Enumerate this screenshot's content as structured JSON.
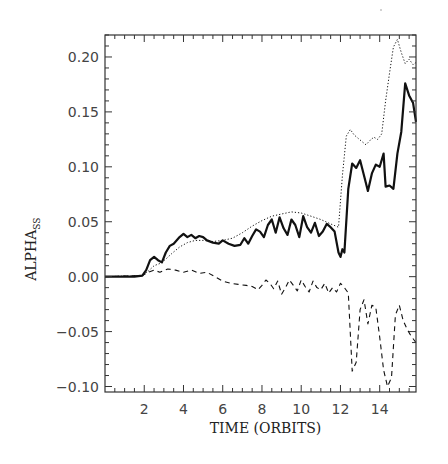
{
  "chart_data": {
    "type": "line",
    "title": "",
    "xlabel": "TIME (ORBITS)",
    "ylabel": "ALPHA",
    "ylabel_subscript": "SS",
    "xlim": [
      0,
      15.85
    ],
    "ylim": [
      -0.105,
      0.22
    ],
    "x_ticks": [
      2,
      4,
      6,
      8,
      10,
      12,
      14
    ],
    "x_minor_step": 0.5,
    "y_ticks": [
      -0.1,
      -0.05,
      0.0,
      0.05,
      0.1,
      0.15,
      0.2
    ],
    "y_tick_labels": [
      "−0.10",
      "−0.05",
      "0.00",
      "0.05",
      "0.10",
      "0.15",
      "0.20"
    ],
    "y_minor_step": 0.01,
    "grid": false,
    "legend": null,
    "series": [
      {
        "name": "total (solid)",
        "style": "solid",
        "x": [
          0,
          1.5,
          1.9,
          2.1,
          2.3,
          2.5,
          2.7,
          2.9,
          3.1,
          3.3,
          3.5,
          3.8,
          4.0,
          4.2,
          4.4,
          4.6,
          4.8,
          5.0,
          5.2,
          5.5,
          5.8,
          6.0,
          6.3,
          6.6,
          6.9,
          7.1,
          7.3,
          7.5,
          7.7,
          7.9,
          8.1,
          8.3,
          8.5,
          8.7,
          8.9,
          9.1,
          9.3,
          9.5,
          9.7,
          9.9,
          10.1,
          10.3,
          10.5,
          10.7,
          10.9,
          11.1,
          11.3,
          11.5,
          11.7,
          11.9,
          12.0,
          12.1,
          12.2,
          12.4,
          12.6,
          12.8,
          13.0,
          13.2,
          13.4,
          13.6,
          13.8,
          14.0,
          14.2,
          14.3,
          14.5,
          14.7,
          14.9,
          15.1,
          15.3,
          15.5,
          15.7,
          15.85
        ],
        "y": [
          0.0,
          0.0,
          0.001,
          0.006,
          0.015,
          0.018,
          0.015,
          0.013,
          0.022,
          0.028,
          0.03,
          0.036,
          0.039,
          0.036,
          0.038,
          0.035,
          0.037,
          0.036,
          0.033,
          0.031,
          0.03,
          0.033,
          0.03,
          0.028,
          0.029,
          0.035,
          0.03,
          0.037,
          0.043,
          0.041,
          0.036,
          0.047,
          0.052,
          0.04,
          0.054,
          0.044,
          0.038,
          0.052,
          0.047,
          0.036,
          0.055,
          0.045,
          0.04,
          0.049,
          0.037,
          0.041,
          0.048,
          0.045,
          0.041,
          0.022,
          0.018,
          0.025,
          0.022,
          0.08,
          0.103,
          0.099,
          0.106,
          0.092,
          0.078,
          0.094,
          0.102,
          0.1,
          0.112,
          0.082,
          0.083,
          0.08,
          0.112,
          0.132,
          0.176,
          0.165,
          0.158,
          0.141
        ]
      },
      {
        "name": "dotted",
        "style": "dotted",
        "x": [
          0,
          1.9,
          2.2,
          2.5,
          2.8,
          3.1,
          3.4,
          3.8,
          4.2,
          4.6,
          5.0,
          5.5,
          6.0,
          6.5,
          7.0,
          7.5,
          8.0,
          8.5,
          9.0,
          9.5,
          10.0,
          10.5,
          11.0,
          11.5,
          11.9,
          12.1,
          12.3,
          12.5,
          12.7,
          12.9,
          13.1,
          13.3,
          13.5,
          13.7,
          13.9,
          14.1,
          14.3,
          14.5,
          14.7,
          14.9,
          15.1,
          15.3,
          15.5,
          15.7,
          15.85
        ],
        "y": [
          0.0,
          0.001,
          0.005,
          0.01,
          0.012,
          0.016,
          0.021,
          0.027,
          0.031,
          0.033,
          0.033,
          0.032,
          0.033,
          0.035,
          0.04,
          0.046,
          0.051,
          0.055,
          0.057,
          0.059,
          0.058,
          0.055,
          0.052,
          0.048,
          0.045,
          0.092,
          0.128,
          0.134,
          0.129,
          0.126,
          0.123,
          0.12,
          0.124,
          0.127,
          0.125,
          0.13,
          0.16,
          0.185,
          0.209,
          0.216,
          0.204,
          0.194,
          0.198,
          0.193,
          0.195
        ]
      },
      {
        "name": "dashed",
        "style": "dashed",
        "x": [
          0,
          1.9,
          2.2,
          2.5,
          2.8,
          3.2,
          3.6,
          4.0,
          4.4,
          4.8,
          5.2,
          5.6,
          6.0,
          6.4,
          6.8,
          7.2,
          7.5,
          7.8,
          8.0,
          8.2,
          8.4,
          8.6,
          8.8,
          9.0,
          9.2,
          9.4,
          9.6,
          9.8,
          10.0,
          10.2,
          10.4,
          10.6,
          10.8,
          11.0,
          11.2,
          11.4,
          11.6,
          11.8,
          12.0,
          12.2,
          12.4,
          12.6,
          12.8,
          13.0,
          13.2,
          13.4,
          13.6,
          13.8,
          14.0,
          14.2,
          14.4,
          14.6,
          14.8,
          15.0,
          15.2,
          15.4,
          15.6,
          15.85
        ],
        "y": [
          0.0,
          0.001,
          0.004,
          0.006,
          0.004,
          0.007,
          0.006,
          0.004,
          0.006,
          0.003,
          0.004,
          0.0,
          -0.004,
          -0.006,
          -0.007,
          -0.008,
          -0.009,
          -0.012,
          -0.008,
          -0.003,
          -0.006,
          -0.011,
          -0.004,
          -0.016,
          -0.01,
          -0.003,
          -0.008,
          -0.013,
          -0.003,
          -0.009,
          -0.014,
          -0.004,
          -0.01,
          -0.012,
          -0.006,
          -0.015,
          -0.01,
          -0.014,
          -0.006,
          -0.01,
          -0.015,
          -0.086,
          -0.078,
          -0.03,
          -0.021,
          -0.043,
          -0.026,
          -0.028,
          -0.055,
          -0.085,
          -0.1,
          -0.092,
          -0.035,
          -0.026,
          -0.04,
          -0.048,
          -0.054,
          -0.06
        ]
      }
    ]
  },
  "colors": {
    "axis": "#333333",
    "line": "#111111",
    "tick_label": "#444444"
  }
}
